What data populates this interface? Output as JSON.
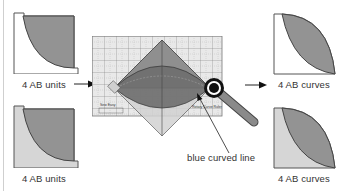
{
  "diagram": {
    "left_column": {
      "top_piece": {
        "label": "4 AB units",
        "background_fill": "#ffffff",
        "quarter_circle_fill": "#939393"
      },
      "bottom_piece": {
        "label": "4 AB units",
        "background_fill": "#d6d6d6",
        "quarter_circle_fill": "#939393"
      }
    },
    "center": {
      "ruler": {
        "grid_color": "#ffffff",
        "background": "#eaeaea",
        "line_color": "#6b6b6b"
      },
      "diamond_fill": "#8a8a8a",
      "lens_fill": "#6e6e6e",
      "callout_label": "blue curved line",
      "ruler_brand_text": "Sew Easy",
      "ruler_name_text": "Rotary Curve Ruler"
    },
    "right_column": {
      "top_piece": {
        "label": "4 AB curves",
        "background_fill": "#ffffff",
        "petal_fill": "#939393"
      },
      "bottom_piece": {
        "label": "4 AB curves",
        "background_fill": "#d6d6d6",
        "petal_fill": "#939393"
      }
    },
    "arrows": [
      {
        "from": "left_column.top_piece",
        "to": "center.ruler",
        "direction": "right"
      },
      {
        "from": "center.ruler",
        "to": "right_column.top_piece",
        "direction": "right"
      }
    ],
    "icons": [
      "arrow-right-icon",
      "rotary-cutter-icon",
      "callout-arrow-icon"
    ]
  }
}
